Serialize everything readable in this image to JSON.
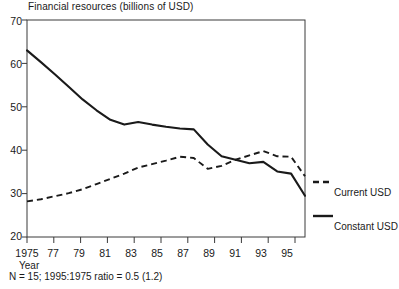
{
  "chart_data": {
    "type": "line",
    "title": "Financial resources (billions of USD)",
    "xlabel": "Year",
    "ylabel": "",
    "xlim": [
      1975,
      1995
    ],
    "ylim": [
      20,
      70
    ],
    "yticks": [
      20,
      30,
      40,
      50,
      60,
      70
    ],
    "xticks": [
      1975,
      1977,
      1979,
      1981,
      1983,
      1985,
      1987,
      1989,
      1991,
      1993,
      1995
    ],
    "xtick_labels": [
      "1975",
      "77",
      "79",
      "81",
      "83",
      "85",
      "87",
      "89",
      "91",
      "93",
      "95"
    ],
    "grid": false,
    "legend_position": "right",
    "x": [
      1975,
      1976,
      1977,
      1978,
      1979,
      1980,
      1981,
      1982,
      1983,
      1984,
      1985,
      1986,
      1987,
      1988,
      1989,
      1990,
      1991,
      1992,
      1993,
      1994,
      1995
    ],
    "series": [
      {
        "name": "Current USD",
        "style": "dashed",
        "color": "#1a1a1a",
        "values": [
          28.2,
          28.7,
          29.4,
          30.1,
          31.0,
          32.2,
          33.4,
          34.6,
          36.0,
          36.8,
          37.6,
          38.5,
          38.2,
          35.7,
          36.4,
          37.8,
          38.8,
          39.8,
          38.6,
          38.5,
          34.0
        ]
      },
      {
        "name": "Constant USD",
        "style": "solid",
        "color": "#1a1a1a",
        "values": [
          63.0,
          60.3,
          57.5,
          54.6,
          51.7,
          49.2,
          47.0,
          45.9,
          46.5,
          45.9,
          45.4,
          45.0,
          44.8,
          41.3,
          38.6,
          37.8,
          37.0,
          37.3,
          35.1,
          34.6,
          29.5
        ]
      }
    ],
    "annotations": [
      "N = 15; 1995:1975 ratio = 0.5 (1.2)"
    ]
  },
  "chart": {
    "title": "Financial resources (billions of USD)",
    "x_axis_name": "Year",
    "footnote": "N = 15; 1995:1975 ratio = 0.5 (1.2)",
    "y_tick_labels": [
      "70",
      "60",
      "50",
      "40",
      "30",
      "20"
    ],
    "x_tick_labels": [
      "1975",
      "77",
      "79",
      "81",
      "83",
      "85",
      "87",
      "89",
      "91",
      "93",
      "95"
    ],
    "legend": [
      {
        "label": "Current USD",
        "style": "dashed"
      },
      {
        "label": "Constant USD",
        "style": "solid"
      }
    ]
  }
}
